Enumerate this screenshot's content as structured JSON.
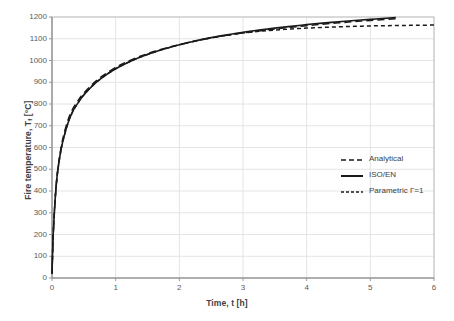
{
  "chart_data": {
    "type": "line",
    "title": "",
    "xlabel": "Time, t [h]",
    "ylabel_text": "Fire temperature, T",
    "ylabel_sub": "f",
    "ylabel_unit": " [°C]",
    "ylabel": "Fire temperature, Tf [°C]",
    "xlim": [
      0,
      6
    ],
    "ylim": [
      0,
      1200
    ],
    "xticks": [
      0,
      1,
      2,
      3,
      4,
      5,
      6
    ],
    "yticks": [
      0,
      100,
      200,
      300,
      400,
      500,
      600,
      700,
      800,
      900,
      1000,
      1100,
      1200
    ],
    "xtick_labels": [
      "0",
      "1",
      "2",
      "3",
      "4",
      "5",
      "6"
    ],
    "ytick_labels": [
      "0",
      "100",
      "200",
      "300",
      "400",
      "500",
      "600",
      "700",
      "800",
      "900",
      "1000",
      "1100",
      "1200"
    ],
    "grid": true,
    "grid_color": "#e4e4e4",
    "axis_color": "#bfbfbf",
    "legend_position": "center-right",
    "series": [
      {
        "name": "Analytical",
        "style": "dashed",
        "dasharray": "7,4",
        "color": "#1a1a1a",
        "width": 1.5,
        "x": [
          0,
          0.02,
          0.05,
          0.08,
          0.12,
          0.17,
          0.25,
          0.33,
          0.42,
          0.5,
          0.65,
          0.8,
          1.0,
          1.2,
          1.4,
          1.6,
          1.8,
          2.0,
          2.25,
          2.5,
          2.75,
          3.0,
          3.25,
          3.5,
          3.75,
          4.0,
          4.25,
          4.5,
          4.75,
          5.0,
          5.25,
          5.4
        ],
        "y": [
          20,
          200,
          360,
          470,
          560,
          640,
          725,
          780,
          820,
          850,
          895,
          930,
          968,
          997,
          1021,
          1041,
          1058,
          1073,
          1090,
          1104,
          1116,
          1127,
          1136,
          1145,
          1153,
          1160,
          1167,
          1173,
          1179,
          1184,
          1189,
          1192
        ]
      },
      {
        "name": "ISO/EN",
        "style": "solid",
        "dasharray": "",
        "color": "#1a1a1a",
        "width": 1.6,
        "x": [
          0,
          0.02,
          0.05,
          0.08,
          0.12,
          0.17,
          0.25,
          0.33,
          0.42,
          0.5,
          0.65,
          0.8,
          1.0,
          1.2,
          1.4,
          1.6,
          1.8,
          2.0,
          2.25,
          2.5,
          2.75,
          3.0,
          3.25,
          3.5,
          3.75,
          4.0,
          4.25,
          4.5,
          4.75,
          5.0,
          5.25,
          5.4
        ],
        "y": [
          20,
          206,
          365,
          468,
          552,
          628,
          712,
          768,
          810,
          842,
          888,
          924,
          962,
          992,
          1017,
          1038,
          1056,
          1072,
          1090,
          1105,
          1118,
          1130,
          1140,
          1149,
          1157,
          1165,
          1172,
          1178,
          1184,
          1189,
          1194,
          1197
        ]
      },
      {
        "name": "Parametric Γ=1",
        "style": "short-dashed",
        "dasharray": "4,3",
        "color": "#1a1a1a",
        "width": 1.5,
        "x": [
          0,
          0.02,
          0.05,
          0.08,
          0.12,
          0.17,
          0.25,
          0.33,
          0.42,
          0.5,
          0.65,
          0.8,
          1.0,
          1.2,
          1.4,
          1.6,
          1.8,
          2.0,
          2.25,
          2.5,
          2.75,
          3.0,
          3.25,
          3.5,
          3.75,
          4.0,
          4.25,
          4.5,
          4.75,
          5.0,
          5.25,
          5.5,
          5.75,
          6.0
        ],
        "y": [
          20,
          206,
          365,
          468,
          552,
          628,
          712,
          768,
          810,
          842,
          888,
          924,
          962,
          992,
          1017,
          1038,
          1056,
          1072,
          1090,
          1104,
          1116,
          1126,
          1134,
          1140,
          1145,
          1149,
          1152,
          1155,
          1157,
          1159,
          1160,
          1161,
          1162,
          1163
        ]
      }
    ],
    "legend": [
      {
        "label": "Analytical",
        "dasharray": "5,3",
        "color": "#1a1a1a",
        "width": 1.6
      },
      {
        "label": "ISO/EN",
        "dasharray": "",
        "color": "#1a1a1a",
        "width": 2.0
      },
      {
        "label": "Parametric Γ=1",
        "dasharray": "3,2",
        "color": "#1a1a1a",
        "width": 1.6
      }
    ]
  }
}
